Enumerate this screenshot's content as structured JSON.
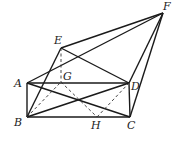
{
  "diagram": {
    "type": "geometry",
    "points": {
      "A": {
        "label": "A",
        "x": 27,
        "y": 83,
        "lx": 14,
        "ly": 87
      },
      "B": {
        "label": "B",
        "x": 27,
        "y": 117,
        "lx": 14,
        "ly": 126
      },
      "C": {
        "label": "C",
        "x": 130,
        "y": 117,
        "lx": 127,
        "ly": 129
      },
      "D": {
        "label": "D",
        "x": 129,
        "y": 83,
        "lx": 131,
        "ly": 90
      },
      "E": {
        "label": "E",
        "x": 61,
        "y": 48,
        "lx": 54,
        "ly": 44
      },
      "F": {
        "label": "F",
        "x": 163,
        "y": 13,
        "lx": 163,
        "ly": 10
      },
      "G": {
        "label": "G",
        "x": 61,
        "y": 82,
        "lx": 63,
        "ly": 80
      },
      "H": {
        "label": "H",
        "x": 97,
        "y": 117,
        "lx": 91,
        "ly": 129
      }
    },
    "solid_segments": [
      [
        "A",
        "B"
      ],
      [
        "B",
        "C"
      ],
      [
        "C",
        "D"
      ],
      [
        "D",
        "A"
      ],
      [
        "A",
        "C"
      ],
      [
        "B",
        "D"
      ],
      [
        "E",
        "B"
      ],
      [
        "E",
        "D"
      ],
      [
        "E",
        "F"
      ],
      [
        "A",
        "F"
      ],
      [
        "D",
        "F"
      ],
      [
        "C",
        "F"
      ]
    ],
    "dashed_segments": [
      [
        "E",
        "G"
      ],
      [
        "B",
        "G"
      ],
      [
        "G",
        "H"
      ],
      [
        "H",
        "D"
      ]
    ]
  }
}
